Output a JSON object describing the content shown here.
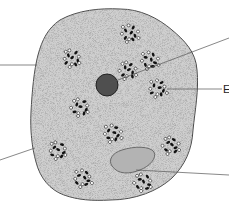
{
  "diagram": {
    "title": "",
    "colors": {
      "cytoplasm": "#cfcfcf",
      "membrane": "#4a4a4a",
      "nucleus": "#4f4f4f",
      "vacuole": "#b3b3b3",
      "granule_dark": "#111111",
      "granule_light": "#ffffff",
      "leader_line": "#555555"
    },
    "labels": [
      {
        "id": "label-left-top",
        "text": "",
        "points_to": "cell-membrane"
      },
      {
        "id": "label-left-bottom",
        "text": "",
        "points_to": "cytoplasm"
      },
      {
        "id": "label-top-right",
        "text": "",
        "points_to": "nucleus"
      },
      {
        "id": "label-right-middle",
        "text": "E",
        "points_to": "granule-cluster"
      },
      {
        "id": "label-bottom-right",
        "text": "",
        "points_to": "vacuole"
      }
    ],
    "granule_cluster_count": 11
  }
}
